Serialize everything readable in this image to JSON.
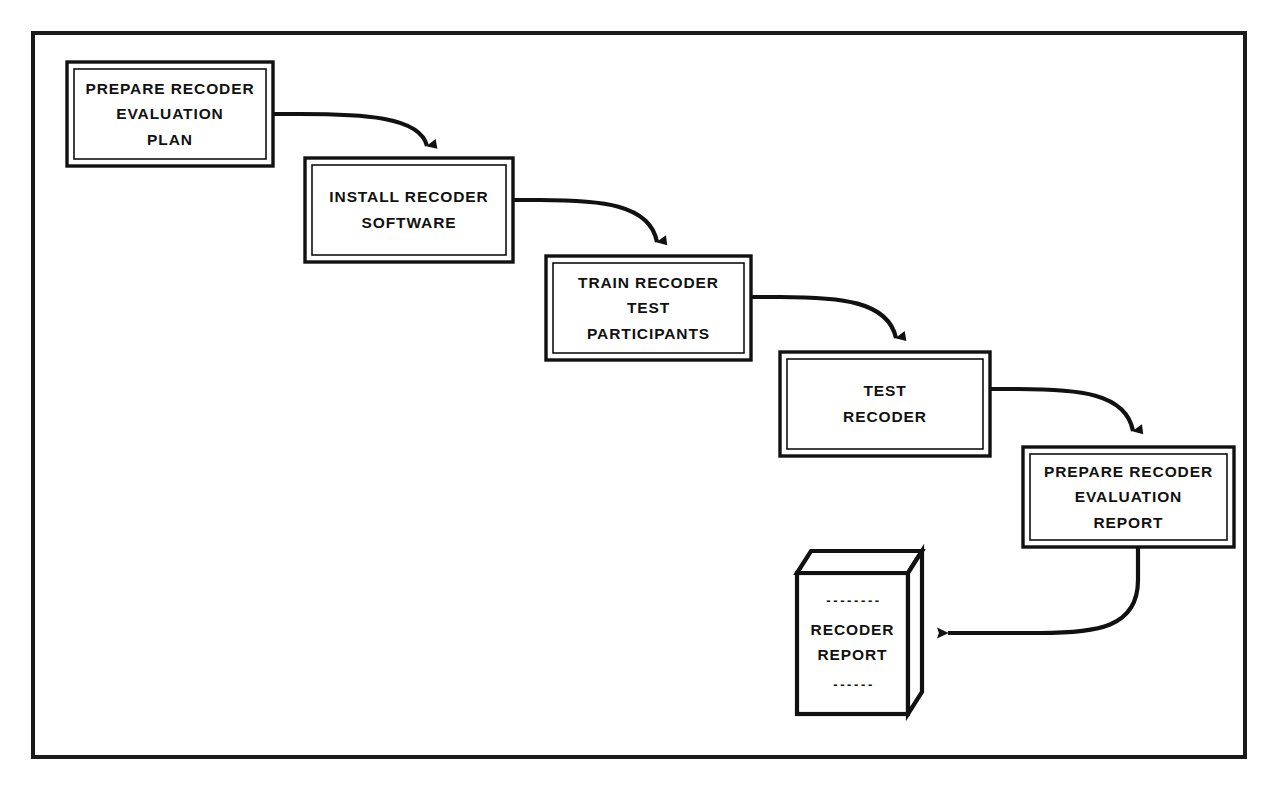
{
  "diagram": {
    "frame": {
      "stroke_color": "#1a1a1a"
    },
    "style": {
      "line_color": "#111111",
      "box_fill": "#ffffff",
      "text_color": "#111111"
    },
    "process_boxes": [
      {
        "id": "prepare-plan",
        "lines": [
          "PREPARE RECODER",
          "EVALUATION",
          "PLAN"
        ],
        "x": 67,
        "y": 62,
        "w": 206,
        "h": 104
      },
      {
        "id": "install-software",
        "lines": [
          "INSTALL RECODER",
          "SOFTWARE"
        ],
        "x": 305,
        "y": 158,
        "w": 208,
        "h": 104
      },
      {
        "id": "train-participants",
        "lines": [
          "TRAIN RECODER",
          "TEST",
          "PARTICIPANTS"
        ],
        "x": 546,
        "y": 256,
        "w": 205,
        "h": 104
      },
      {
        "id": "test-recoder",
        "lines": [
          "TEST",
          "RECODER"
        ],
        "x": 780,
        "y": 352,
        "w": 210,
        "h": 104
      },
      {
        "id": "prepare-report",
        "lines": [
          "PREPARE RECODER",
          "EVALUATION",
          "REPORT"
        ],
        "x": 1023,
        "y": 447,
        "w": 211,
        "h": 100
      }
    ],
    "document": {
      "id": "recoder-report-doc",
      "lines": [
        "RECODER",
        "REPORT"
      ],
      "dash_top": "- - - - - - - -",
      "dash_bottom": "- - - - - -",
      "x": 797,
      "y": 551,
      "w": 125,
      "h": 163
    },
    "connectors": [
      {
        "id": "plan-to-install",
        "from": "prepare-plan",
        "to": "install-software",
        "arrow": "down"
      },
      {
        "id": "install-to-train",
        "from": "install-software",
        "to": "train-participants",
        "arrow": "down"
      },
      {
        "id": "train-to-test",
        "from": "train-participants",
        "to": "test-recoder",
        "arrow": "down"
      },
      {
        "id": "test-to-report",
        "from": "test-recoder",
        "to": "prepare-report",
        "arrow": "down"
      },
      {
        "id": "report-to-document",
        "from": "prepare-report",
        "to": "recoder-report-doc",
        "arrow": "left"
      }
    ]
  }
}
